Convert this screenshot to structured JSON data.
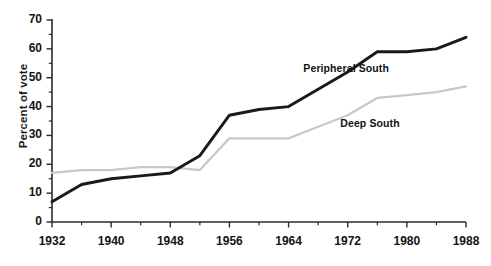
{
  "chart_data": {
    "type": "line",
    "title": "",
    "xlabel": "",
    "ylabel": "Percent of vote",
    "xlim": [
      1932,
      1988
    ],
    "ylim": [
      0,
      70
    ],
    "grid": false,
    "legend_position": "inline-annotations",
    "x": [
      1932,
      1936,
      1940,
      1944,
      1948,
      1952,
      1956,
      1960,
      1964,
      1968,
      1972,
      1976,
      1980,
      1984,
      1988
    ],
    "xtick_labels": [
      "1932",
      "1940",
      "1948",
      "1956",
      "1964",
      "1972",
      "1980",
      "1988"
    ],
    "xtick_values": [
      1932,
      1940,
      1948,
      1956,
      1964,
      1972,
      1980,
      1988
    ],
    "xtick_minor_values": [
      1936,
      1944,
      1952,
      1960,
      1968,
      1976,
      1984
    ],
    "ytick_labels": [
      "0",
      "10",
      "20",
      "30",
      "40",
      "50",
      "60",
      "70"
    ],
    "ytick_values": [
      0,
      10,
      20,
      30,
      40,
      50,
      60,
      70
    ],
    "ytick_minor_values": [
      5,
      15,
      25,
      35,
      45,
      55,
      65
    ],
    "series": [
      {
        "name": "Peripheral South",
        "color": "#1a1a1a",
        "values": [
          7,
          13,
          15,
          16,
          17,
          23,
          37,
          39,
          40,
          46,
          52,
          59,
          59,
          60,
          64
        ],
        "label_x": 1966,
        "label_y": 53
      },
      {
        "name": "Deep South",
        "color": "#c8c8c8",
        "values": [
          17,
          18,
          18,
          19,
          19,
          18,
          29,
          29,
          29,
          33,
          37,
          43,
          44,
          45,
          47
        ],
        "label_x": 1971,
        "label_y": 34
      }
    ]
  }
}
